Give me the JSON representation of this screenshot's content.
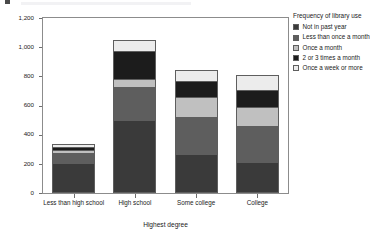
{
  "figure": {
    "width": 386,
    "height": 238,
    "background": "#ffffff"
  },
  "legend": {
    "title": "Frequency of library use",
    "position": "right",
    "items": [
      {
        "label": "Not in past year",
        "color": "#3a3a3a"
      },
      {
        "label": "Less than once a month",
        "color": "#5e5e5e"
      },
      {
        "label": "Once a month",
        "color": "#c0c0c0"
      },
      {
        "label": "2 or 3 times a month",
        "color": "#1c1c1c"
      },
      {
        "label": "Once a week or more",
        "color": "#ececec"
      }
    ]
  },
  "axes": {
    "y": {
      "label": "Count",
      "ticks": [
        "0",
        "200",
        "400",
        "600",
        "800",
        "1,000",
        "1,200"
      ],
      "min": 0,
      "max": 1200
    },
    "x": {
      "label": "Highest degree",
      "ticks": [
        "Less than high school",
        "High school",
        "Some college",
        "College"
      ]
    }
  },
  "chart_data": {
    "type": "bar",
    "subtype": "stacked",
    "title": "",
    "xlabel": "Highest degree",
    "ylabel": "Count",
    "ylim": [
      0,
      1200
    ],
    "grid": false,
    "legend_title": "Frequency of library use",
    "legend_position": "right",
    "categories": [
      "Less than high school",
      "High school",
      "Some college",
      "College"
    ],
    "series": [
      {
        "name": "Not in past year",
        "color": "#3a3a3a",
        "values": [
          208,
          498,
          268,
          216
        ]
      },
      {
        "name": "Less than once a month",
        "color": "#5e5e5e",
        "values": [
          63,
          232,
          252,
          243
        ]
      },
      {
        "name": "Once a month",
        "color": "#c0c0c0",
        "values": [
          21,
          54,
          136,
          131
        ]
      },
      {
        "name": "2 or 3 times a month",
        "color": "#1c1c1c",
        "values": [
          24,
          193,
          112,
          119
        ]
      },
      {
        "name": "Once a week or more",
        "color": "#ececec",
        "values": [
          18,
          75,
          77,
          102
        ]
      }
    ],
    "totals": [
      334,
      1052,
      845,
      811
    ]
  }
}
